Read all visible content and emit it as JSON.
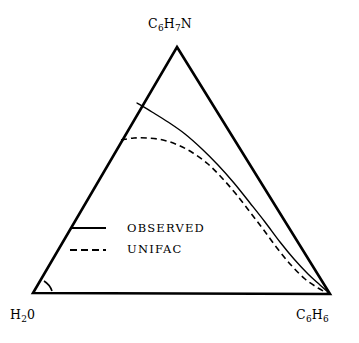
{
  "figure": {
    "type": "ternary-phase-diagram",
    "background_color": "#ffffff",
    "line_color": "#000000",
    "width": 359,
    "height": 343
  },
  "vertices": {
    "apex": {
      "name": "aniline",
      "formula_prefix": "C",
      "sub1": "6",
      "mid": "H",
      "sub2": "7",
      "suffix": "N",
      "text": "C6H7N",
      "x": 177,
      "y": 47
    },
    "bottom_left": {
      "name": "water",
      "formula_prefix": "H",
      "sub1": "2",
      "suffix": "0",
      "text": "H20",
      "x": 33,
      "y": 293
    },
    "bottom_right": {
      "name": "benzene",
      "formula_prefix": "C",
      "sub1": "6",
      "mid": "H",
      "sub2": "6",
      "text": "C6H6",
      "x": 330,
      "y": 294
    }
  },
  "legend": {
    "position": "inside-lower-left",
    "entries": [
      {
        "label": "OBSERVED",
        "style": "solid",
        "swatch_x1": 70,
        "swatch_x2": 106,
        "swatch_y": 228,
        "label_x": 127,
        "label_y": 223
      },
      {
        "label": "UNIFAC",
        "style": "dashed",
        "swatch_x1": 70,
        "swatch_x2": 106,
        "swatch_y": 250,
        "label_x": 127,
        "label_y": 244
      }
    ]
  },
  "chart_data": {
    "type": "line",
    "title": "",
    "xlabel": "",
    "ylabel": "",
    "diagram": "ternary liquid-liquid equilibrium binodal curves",
    "axis_components": [
      "H20",
      "C6H7N",
      "C6H6"
    ],
    "triangle_corners_px": {
      "apex": [
        177,
        47
      ],
      "bottom_left": [
        33,
        293
      ],
      "bottom_right": [
        330,
        294
      ]
    },
    "grid": false,
    "legend_position": "inside-lower-left",
    "series": [
      {
        "name": "OBSERVED",
        "style": "solid",
        "stroke_width": 1.4,
        "points_px": [
          [
            137,
            103
          ],
          [
            152,
            112
          ],
          [
            168,
            122
          ],
          [
            185,
            134
          ],
          [
            202,
            149
          ],
          [
            218,
            165
          ],
          [
            234,
            183
          ],
          [
            250,
            203
          ],
          [
            265,
            222
          ],
          [
            280,
            242
          ],
          [
            294,
            259
          ],
          [
            308,
            274
          ],
          [
            320,
            285
          ],
          [
            329,
            293
          ]
        ]
      },
      {
        "name": "UNIFAC",
        "style": "dashed",
        "stroke_width": 1.6,
        "dash_pattern": "6,4",
        "points_px": [
          [
            121,
            140
          ],
          [
            134,
            138
          ],
          [
            148,
            138
          ],
          [
            163,
            140
          ],
          [
            178,
            145
          ],
          [
            193,
            153
          ],
          [
            208,
            164
          ],
          [
            222,
            178
          ],
          [
            236,
            194
          ],
          [
            250,
            212
          ],
          [
            263,
            229
          ],
          [
            277,
            248
          ],
          [
            291,
            265
          ],
          [
            305,
            279
          ],
          [
            318,
            288
          ],
          [
            329,
            294
          ]
        ]
      }
    ]
  }
}
